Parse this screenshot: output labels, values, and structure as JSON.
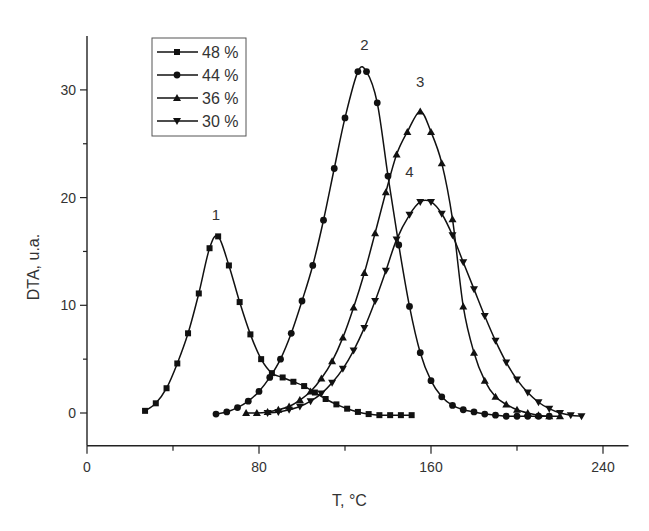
{
  "chart_data": {
    "type": "line",
    "title": "",
    "xlabel": "T, °C",
    "ylabel": "DTA, u.a.",
    "xlim": [
      0,
      250
    ],
    "ylim": [
      -3,
      35
    ],
    "xticks": [
      0,
      80,
      160,
      240
    ],
    "yticks": [
      0,
      10,
      20,
      30
    ],
    "grid": false,
    "legend_position": "upper left",
    "series": [
      {
        "name": "48 %",
        "marker": "square",
        "peak_label": "1",
        "x": [
          27,
          32,
          37,
          42,
          47,
          52,
          57,
          61,
          66,
          71,
          76,
          81,
          86,
          91,
          96,
          101,
          106,
          111,
          116,
          121,
          126,
          131,
          136,
          141,
          146,
          151
        ],
        "y": [
          0.2,
          0.9,
          2.3,
          4.6,
          7.4,
          11.1,
          15.3,
          16.4,
          13.7,
          10.3,
          7.3,
          5.0,
          3.7,
          3.3,
          2.9,
          2.5,
          1.9,
          1.3,
          0.8,
          0.4,
          0.1,
          -0.1,
          -0.2,
          -0.2,
          -0.2,
          -0.2
        ]
      },
      {
        "name": "44 %",
        "marker": "circle",
        "peak_label": "2",
        "x": [
          60,
          65,
          70,
          75,
          80,
          85,
          90,
          95,
          100,
          105,
          110,
          115,
          120,
          126,
          130,
          135,
          140,
          145,
          150,
          155,
          160,
          165,
          170,
          175,
          180,
          185,
          190,
          195,
          200,
          205,
          210,
          215
        ],
        "y": [
          -0.1,
          0.1,
          0.5,
          1.1,
          2.0,
          3.3,
          5.0,
          7.4,
          10.4,
          13.7,
          17.9,
          22.7,
          27.4,
          31.7,
          31.7,
          28.8,
          22.0,
          15.6,
          9.9,
          5.6,
          3.0,
          1.5,
          0.7,
          0.3,
          0.1,
          -0.1,
          -0.2,
          -0.3,
          -0.3,
          -0.3,
          -0.3,
          -0.3
        ]
      },
      {
        "name": "36 %",
        "marker": "triangle-up",
        "peak_label": "3",
        "x": [
          74,
          79,
          84,
          89,
          94,
          99,
          104,
          109,
          114,
          119,
          124,
          129,
          134,
          139,
          144,
          149,
          155,
          160,
          165,
          170,
          175,
          180,
          185,
          190,
          195,
          200,
          205,
          210,
          215,
          220
        ],
        "y": [
          0.0,
          0.0,
          0.1,
          0.3,
          0.6,
          1.2,
          2.0,
          3.2,
          4.8,
          7.0,
          9.8,
          13.0,
          16.7,
          20.5,
          24.0,
          26.1,
          28.0,
          26.1,
          23.2,
          18.0,
          9.9,
          5.6,
          3.0,
          1.5,
          0.8,
          0.3,
          0.0,
          -0.2,
          -0.3,
          -0.3
        ]
      },
      {
        "name": "30 %",
        "marker": "triangle-down",
        "peak_label": "4",
        "x": [
          84,
          89,
          94,
          99,
          104,
          109,
          114,
          119,
          124,
          129,
          134,
          139,
          144,
          150,
          155,
          160,
          165,
          170,
          175,
          180,
          185,
          190,
          195,
          200,
          205,
          210,
          215,
          220,
          225,
          230
        ],
        "y": [
          0.0,
          0.1,
          0.3,
          0.6,
          1.1,
          1.8,
          2.8,
          4.1,
          5.8,
          7.9,
          10.4,
          13.2,
          16.1,
          18.4,
          19.6,
          19.6,
          18.5,
          16.5,
          14.0,
          11.5,
          9.0,
          6.7,
          4.7,
          3.1,
          1.9,
          1.0,
          0.4,
          0.0,
          -0.2,
          -0.3
        ]
      }
    ],
    "annotations": [
      {
        "text": "1",
        "x": 60,
        "y": 17.9
      },
      {
        "text": "2",
        "x": 129,
        "y": 33.7
      },
      {
        "text": "3",
        "x": 155,
        "y": 30.3
      },
      {
        "text": "4",
        "x": 150,
        "y": 21.9
      }
    ]
  },
  "axes": {
    "x_label": "T, °C",
    "y_label": "DTA, u.a.",
    "x_tick_labels": [
      "0",
      "80",
      "160",
      "240"
    ],
    "y_tick_labels": [
      "0",
      "10",
      "20",
      "30"
    ]
  },
  "legend": {
    "items": [
      {
        "label": "48 %",
        "marker": "square"
      },
      {
        "label": "44 %",
        "marker": "circle"
      },
      {
        "label": "36 %",
        "marker": "triangle-up"
      },
      {
        "label": "30 %",
        "marker": "triangle-down"
      }
    ]
  }
}
